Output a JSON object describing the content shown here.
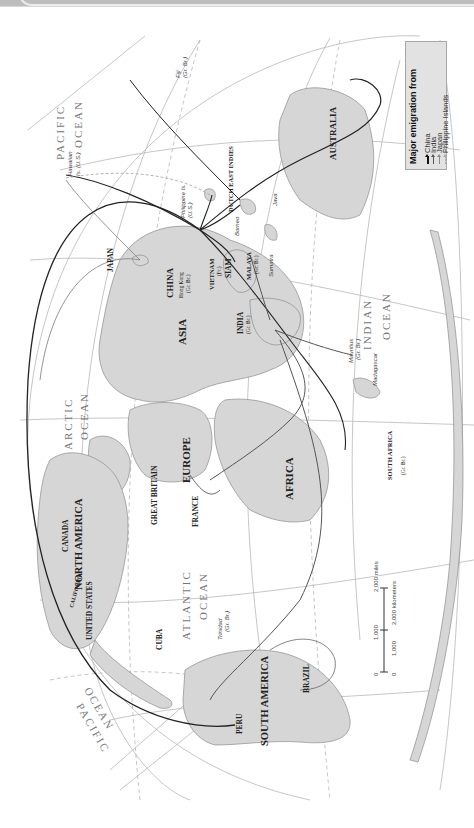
{
  "legend": {
    "title": "Major emigration from",
    "items": [
      {
        "label": "China",
        "color": "#111111",
        "style": "solid-thick"
      },
      {
        "label": "India",
        "color": "#555555",
        "style": "solid"
      },
      {
        "label": "Japan",
        "color": "#8a8a8a",
        "style": "solid-thin"
      },
      {
        "label": "Philippine Islands",
        "color": "#aaaaaa",
        "style": "dashed"
      }
    ]
  },
  "scale": {
    "miles_labels": [
      "0",
      "1,000",
      "2,000 miles"
    ],
    "km_labels": [
      "0",
      "1,000",
      "2,000 kilometers"
    ]
  },
  "regions": {
    "north_america": "NORTH AMERICA",
    "south_america": "SOUTH AMERICA",
    "asia": "ASIA",
    "europe": "EUROPE",
    "africa": "AFRICA",
    "australia": "AUSTRALIA"
  },
  "countries": {
    "canada": "CANADA",
    "united_states": "UNITED STATES",
    "california": "CALIFORNIA",
    "cuba": "CUBA",
    "peru": "PERU",
    "brazil": "BRAZIL",
    "great_britain": "GREAT BRITAIN",
    "france": "FRANCE",
    "china": "CHINA",
    "japan": "JAPAN",
    "india": "INDIA",
    "india_sub": "(Gr. Br.)",
    "vietnam": "VIETNAM",
    "vietnam_sub": "(Fr.)",
    "siam": "SIAM",
    "malaya": "MALAYA",
    "malaya_sub": "(Gr. Br.)",
    "dutch_east_indies": "DUTCH EAST INDIES",
    "south_africa": "SOUTH AFRICA",
    "south_africa_sub": "(Gr. Br.)"
  },
  "places": {
    "hong_kong": "Hong Kong",
    "hong_kong_sub": "(Gr. Br.)",
    "hawaiian": "Hawaiian",
    "hawaiian_sub": "Is. (U.S.)",
    "philippine": "Philippine Is.",
    "philippine_sub": "(U.S.)",
    "fiji": "Fiji",
    "fiji_sub": "(Gr. Br.)",
    "borneo": "Borneo",
    "java": "Java",
    "sumatra": "Sumatra",
    "mauritius": "Mauritius",
    "mauritius_sub": "(Gr. Br.)",
    "madagascar": "Madagascar",
    "trinidad": "Trinidad",
    "trinidad_sub": "(Gr. Br.)"
  },
  "oceans": {
    "pacific_east_1": "PACIFIC",
    "pacific_east_2": "OCEAN",
    "pacific_west_1": "PACIFIC",
    "pacific_west_2": "OCEAN",
    "indian_1": "INDIAN",
    "indian_2": "OCEAN",
    "atlantic_1": "ATLANTIC",
    "atlantic_2": "OCEAN",
    "arctic_1": "ARCTIC",
    "arctic_2": "OCEAN"
  },
  "colors": {
    "land": "#d6d6d6",
    "land_stroke": "#8c8c8c",
    "graticule": "#b5b5b5",
    "background": "#ffffff",
    "legend_bg": "#e2e2e2"
  }
}
